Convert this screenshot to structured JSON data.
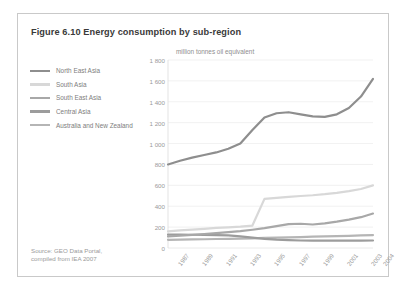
{
  "figure": {
    "title": "Figure 6.10 Energy consumption by sub-region",
    "unit_label": "million tonnes oil equivalent",
    "source_line1": "Source: GEO Data Portal,",
    "source_line2": "compiled from IEA 2007"
  },
  "colors": {
    "north_east_asia": "#8e8e8e",
    "south_asia": "#d8d8d8",
    "south_east_asia": "#a8a8a8",
    "central_asia": "#9c9c9c",
    "australia_new_zealand": "#b5b5b5",
    "grid": "#e8e8e8",
    "axis_text": "#9a9a9a",
    "title_text": "#3a3a3a",
    "frame": "#c9c9c9"
  },
  "chart_data": {
    "type": "line",
    "title": "Figure 6.10 Energy consumption by sub-region",
    "xlabel": "",
    "ylabel": "million tonnes oil equivalent",
    "ylim": [
      0,
      1800
    ],
    "ytick_step": 200,
    "yticks": [
      "0",
      "200",
      "400",
      "600",
      "800",
      "1 000",
      "1 200",
      "1 400",
      "1 600",
      "1 800"
    ],
    "grid": true,
    "legend_position": "left",
    "x": [
      1987,
      1988,
      1989,
      1990,
      1991,
      1992,
      1993,
      1994,
      1995,
      1996,
      1997,
      1998,
      1999,
      2000,
      2001,
      2002,
      2003,
      2004
    ],
    "xticks": [
      "1987",
      "1989",
      "1991",
      "1993",
      "1995",
      "1997",
      "1999",
      "2001",
      "2003",
      "2004"
    ],
    "series": [
      {
        "name": "North East Asia",
        "color": "#8e8e8e",
        "values": [
          800,
          835,
          865,
          890,
          915,
          950,
          1000,
          1130,
          1250,
          1290,
          1300,
          1280,
          1260,
          1255,
          1280,
          1340,
          1450,
          1620
        ]
      },
      {
        "name": "South Asia",
        "color": "#d8d8d8",
        "values": [
          160,
          168,
          176,
          184,
          192,
          198,
          205,
          215,
          470,
          480,
          490,
          498,
          505,
          515,
          528,
          545,
          565,
          600
        ]
      },
      {
        "name": "South East Asia",
        "color": "#a8a8a8",
        "values": [
          110,
          118,
          126,
          134,
          143,
          152,
          162,
          175,
          190,
          210,
          228,
          232,
          225,
          235,
          252,
          272,
          295,
          330
        ]
      },
      {
        "name": "Central Asia",
        "color": "#9c9c9c",
        "values": [
          128,
          128,
          127,
          126,
          124,
          120,
          112,
          100,
          88,
          80,
          75,
          72,
          70,
          70,
          70,
          70,
          70,
          72
        ]
      },
      {
        "name": "Australia and New Zealand",
        "color": "#b5b5b5",
        "values": [
          78,
          80,
          82,
          84,
          86,
          88,
          90,
          93,
          96,
          99,
          102,
          105,
          108,
          111,
          114,
          117,
          120,
          124
        ]
      }
    ]
  },
  "legend": {
    "items": [
      {
        "label": "North East Asia",
        "color": "#8e8e8e"
      },
      {
        "label": "South Asia",
        "color": "#d8d8d8"
      },
      {
        "label": "South East Asia",
        "color": "#a8a8a8"
      },
      {
        "label": "Central Asia",
        "color": "#9c9c9c"
      },
      {
        "label": "Australia and New Zealand",
        "color": "#b5b5b5"
      }
    ]
  }
}
